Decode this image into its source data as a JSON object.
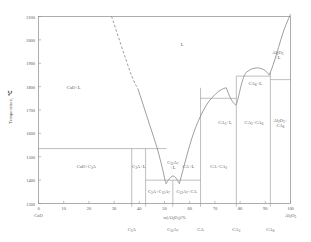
{
  "chart_data": {
    "type": "line",
    "xlabel": "w(Al₂O₃)/%",
    "ylabel": "Temperature, ℃",
    "xlim": [
      0,
      100
    ],
    "ylim": [
      1300,
      2100
    ],
    "xticks": [
      "0",
      "10",
      "20",
      "30",
      "40",
      "50",
      "60",
      "70",
      "80",
      "90",
      "100"
    ],
    "yticks": [
      "1300",
      "1400",
      "1500",
      "1600",
      "1700",
      "1800",
      "1900",
      "2000",
      "2100"
    ],
    "grid": false,
    "legend": null,
    "left_endpoint_label": "CaO",
    "right_endpoint_label": "Al₂O₃",
    "series": [
      {
        "name": "CaO liquidus (dashed, extrapolated)",
        "style": "dashed",
        "points": [
          [
            29.0,
            2100
          ],
          [
            36.5,
            1860
          ],
          [
            39.5,
            1790
          ]
        ]
      },
      {
        "name": "CaO liquidus (solid)",
        "style": "solid",
        "points": [
          [
            39.5,
            1790
          ],
          [
            44.0,
            1640
          ],
          [
            47.0,
            1540
          ],
          [
            48.6,
            1475
          ],
          [
            49.6,
            1430
          ],
          [
            50.2,
            1400
          ],
          [
            50.6,
            1385
          ]
        ]
      },
      {
        "name": "C12A7 liquidus dome",
        "style": "solid",
        "points": [
          [
            50.6,
            1385
          ],
          [
            51.5,
            1400
          ],
          [
            52.5,
            1412
          ],
          [
            53.4,
            1418
          ],
          [
            54.3,
            1412
          ],
          [
            55.2,
            1398
          ],
          [
            55.9,
            1385
          ]
        ]
      },
      {
        "name": "CA liquidus",
        "style": "solid",
        "points": [
          [
            55.9,
            1385
          ],
          [
            57.5,
            1450
          ],
          [
            59.5,
            1530
          ],
          [
            61.5,
            1600
          ],
          [
            63.5,
            1655
          ],
          [
            65.5,
            1700
          ],
          [
            67.5,
            1735
          ],
          [
            69.5,
            1760
          ],
          [
            71.5,
            1780
          ],
          [
            73.5,
            1792
          ],
          [
            74.5,
            1795
          ]
        ]
      },
      {
        "name": "CA2 liquidus",
        "style": "solid",
        "points": [
          [
            74.5,
            1795
          ],
          [
            76.0,
            1755
          ],
          [
            77.3,
            1732
          ],
          [
            78.4,
            1723
          ],
          [
            79.2,
            1750
          ],
          [
            80.3,
            1800
          ],
          [
            81.4,
            1840
          ],
          [
            82.3,
            1860
          ]
        ]
      },
      {
        "name": "CA6 liquidus",
        "style": "solid",
        "points": [
          [
            82.3,
            1860
          ],
          [
            84.5,
            1875
          ],
          [
            86.5,
            1880
          ],
          [
            88.0,
            1878
          ],
          [
            89.5,
            1872
          ],
          [
            90.8,
            1860
          ],
          [
            91.6,
            1850
          ]
        ]
      },
      {
        "name": "Al2O3 liquidus",
        "style": "solid",
        "points": [
          [
            91.6,
            1850
          ],
          [
            93.0,
            1890
          ],
          [
            94.5,
            1940
          ],
          [
            96.0,
            1995
          ],
          [
            97.5,
            2045
          ],
          [
            99.0,
            2085
          ],
          [
            100.0,
            2110
          ]
        ]
      }
    ],
    "horizontals": [
      {
        "name": "CaO + C3A invariant",
        "y": 1535,
        "x0": 0.0,
        "x1": 50.8
      },
      {
        "name": "C3A/C12A7 eutectic line",
        "y": 1400,
        "x0": 42.5,
        "x1": 64.3
      },
      {
        "name": "CA/CA2 invariant",
        "y": 1750,
        "x0": 64.3,
        "x1": 78.5
      },
      {
        "name": "CA2/CA6 invariant",
        "y": 1845,
        "x0": 78.5,
        "x1": 92.0
      },
      {
        "name": "CA6/Al2O3 invariant",
        "y": 1830,
        "x0": 92.0,
        "x1": 100.0
      }
    ],
    "verticals": [
      {
        "name": "C3A composition",
        "x": 37.0,
        "y0": 1300,
        "y1": 1535
      },
      {
        "name": "C3A right boundary",
        "x": 42.5,
        "y0": 1300,
        "y1": 1535
      },
      {
        "name": "C12A7 composition",
        "x": 53.3,
        "y0": 1300,
        "y1": 1400
      },
      {
        "name": "CA composition",
        "x": 64.3,
        "y0": 1300,
        "y1": 1795
      },
      {
        "name": "CA2 composition",
        "x": 78.5,
        "y0": 1300,
        "y1": 1845
      },
      {
        "name": "CA6 composition",
        "x": 92.0,
        "y0": 1300,
        "y1": 1862
      }
    ],
    "compound_ticks": [
      {
        "label": "C₃A",
        "x": 37.0
      },
      {
        "label": "C₁₂A₇",
        "x": 53.3
      },
      {
        "label": "CA",
        "x": 64.3
      },
      {
        "label": "CA₂",
        "x": 78.5
      },
      {
        "label": "CA₆",
        "x": 92.0
      }
    ],
    "region_labels": [
      {
        "text": "CaO+L",
        "x": 14.0,
        "y": 1790
      },
      {
        "text": "L",
        "x": 57.0,
        "y": 1975
      },
      {
        "text": "CaO+C₃A",
        "x": 19.0,
        "y": 1450
      },
      {
        "text": "C₃A+L",
        "x": 39.8,
        "y": 1452
      },
      {
        "text": "C₁₂A₇\n+L",
        "x": 53.3,
        "y": 1468
      },
      {
        "text": "CA+L",
        "x": 59.5,
        "y": 1452
      },
      {
        "text": "C₃A+C₁₂A₇",
        "x": 47.8,
        "y": 1345
      },
      {
        "text": "C₁₂A₇+CA",
        "x": 58.8,
        "y": 1345
      },
      {
        "text": "CA+CA₂",
        "x": 71.5,
        "y": 1452
      },
      {
        "text": "CA₂+L",
        "x": 74.0,
        "y": 1640
      },
      {
        "text": "CA₂+CA₆",
        "x": 85.5,
        "y": 1640
      },
      {
        "text": "CA₆+L",
        "x": 86.0,
        "y": 1808
      },
      {
        "text": "Al₂O₃+\nCA₆",
        "x": 96.0,
        "y": 1648
      },
      {
        "text": "Al₂O₃\n+L",
        "x": 95.0,
        "y": 1938
      }
    ]
  }
}
